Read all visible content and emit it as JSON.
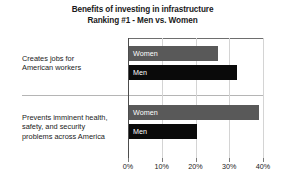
{
  "chart_data": {
    "type": "bar",
    "orientation": "horizontal",
    "title": "Benefits of investing in infrastructure Ranking #1 - Men vs. Women",
    "title_lines": [
      "Benefits of investing in infrastructure",
      "Ranking #1 - Men vs. Women"
    ],
    "xlabel": "",
    "ylabel": "",
    "xlim": [
      0,
      40
    ],
    "xtick_labels": [
      "0%",
      "10%",
      "20%",
      "30%",
      "40%"
    ],
    "xtick_values": [
      0,
      10,
      20,
      30,
      40
    ],
    "grid": true,
    "legend": "in-bar labels",
    "categories": [
      {
        "lines": [
          "Creates jobs for",
          "American workers"
        ],
        "text": "Creates jobs for American workers"
      },
      {
        "lines": [
          "Prevents imminent health,",
          "safety, and security",
          "problems across America"
        ],
        "text": "Prevents imminent health, safety, and security problems across America"
      }
    ],
    "series": [
      {
        "name": "Women",
        "color": "#595959",
        "values": [
          26.5,
          38.5
        ]
      },
      {
        "name": "Men",
        "color": "#0a0a0a",
        "values": [
          32.0,
          20.0
        ]
      }
    ]
  }
}
